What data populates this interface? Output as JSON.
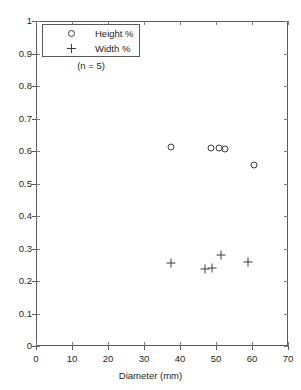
{
  "chart_data": {
    "type": "scatter",
    "title": "",
    "xlabel": "Diameter (mm)",
    "ylabel": "",
    "xlim": [
      0,
      70
    ],
    "ylim": [
      0,
      1
    ],
    "xticks": [
      0,
      10,
      20,
      30,
      40,
      50,
      60,
      70
    ],
    "yticks": [
      0,
      0.1,
      0.2,
      0.3,
      0.4,
      0.5,
      0.6,
      0.7,
      0.8,
      0.9,
      1
    ],
    "xtick_labels": [
      "0",
      "10",
      "20",
      "30",
      "40",
      "50",
      "60",
      "70"
    ],
    "ytick_labels": [
      "0",
      "0.1",
      "0.2",
      "0.3",
      "0.4",
      "0.5",
      "0.6",
      "0.7",
      "0.8",
      "0.9",
      "1"
    ],
    "grid": false,
    "legend_position": "top-left",
    "annotations": [
      {
        "text": "(n = 5)",
        "x": 14,
        "y": 0.885
      }
    ],
    "series": [
      {
        "name": "Height %",
        "marker": "circle",
        "color": "#3b3b3d",
        "points": [
          {
            "x": 37.5,
            "y": 0.612
          },
          {
            "x": 48.6,
            "y": 0.61
          },
          {
            "x": 50.8,
            "y": 0.608
          },
          {
            "x": 52.5,
            "y": 0.605
          },
          {
            "x": 60.5,
            "y": 0.558
          }
        ]
      },
      {
        "name": "Width %",
        "marker": "plus",
        "color": "#3b3b3d",
        "points": [
          {
            "x": 37.5,
            "y": 0.254
          },
          {
            "x": 47.0,
            "y": 0.238
          },
          {
            "x": 49.0,
            "y": 0.24
          },
          {
            "x": 51.5,
            "y": 0.279
          },
          {
            "x": 59.0,
            "y": 0.258
          }
        ]
      }
    ]
  },
  "legend": {
    "entries": [
      {
        "label": "Height %",
        "symbol": "circle-marker"
      },
      {
        "label": "Width %",
        "symbol": "plus-marker"
      }
    ]
  },
  "axes": {
    "x_title": "Diameter (mm)"
  }
}
